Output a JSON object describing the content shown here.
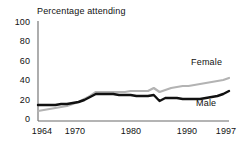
{
  "chart_data": {
    "type": "line",
    "title": "Percentage attending",
    "xlabel": "",
    "ylabel": "",
    "ylim": [
      0,
      100
    ],
    "xlim": [
      1964,
      1997
    ],
    "grid": false,
    "legend_position": "inline-right",
    "yticks": [
      "100",
      "80",
      "60",
      "40",
      "20",
      "0"
    ],
    "ytick_values": [
      100,
      80,
      60,
      40,
      20,
      0
    ],
    "xticks": [
      "1964",
      "1970",
      "1980",
      "1990",
      "1997"
    ],
    "xtick_values": [
      1964,
      1970,
      1980,
      1990,
      1997
    ],
    "x": [
      1964,
      1965,
      1966,
      1967,
      1968,
      1969,
      1970,
      1971,
      1972,
      1973,
      1974,
      1975,
      1976,
      1977,
      1978,
      1979,
      1980,
      1981,
      1982,
      1983,
      1984,
      1985,
      1986,
      1987,
      1988,
      1989,
      1990,
      1991,
      1992,
      1993,
      1994,
      1995,
      1996,
      1997
    ],
    "series": [
      {
        "name": "Male",
        "color": "#111111",
        "values": [
          16,
          16,
          16,
          16,
          17,
          17,
          18,
          19,
          21,
          24,
          27,
          27,
          27,
          27,
          26,
          26,
          26,
          25,
          25,
          25,
          26,
          20,
          23,
          23,
          23,
          22,
          22,
          22,
          22,
          23,
          24,
          25,
          27,
          30
        ]
      },
      {
        "name": "Female",
        "color": "#b3b3b3",
        "values": [
          10,
          11,
          12,
          13,
          14,
          15,
          17,
          19,
          22,
          25,
          29,
          29,
          29,
          29,
          29,
          29,
          30,
          30,
          30,
          30,
          33,
          29,
          31,
          33,
          34,
          35,
          35,
          36,
          37,
          38,
          39,
          40,
          41,
          43
        ]
      }
    ],
    "annotations": [
      {
        "text": "Female",
        "series": "Female"
      },
      {
        "text": "Male",
        "series": "Male"
      }
    ],
    "axis_color": "#6b6b6b"
  }
}
